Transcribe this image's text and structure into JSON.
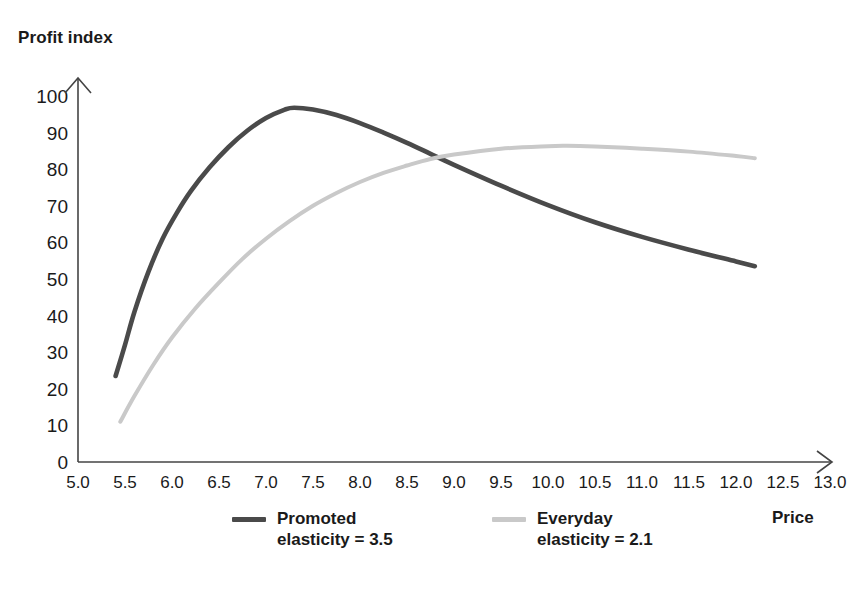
{
  "chart_data": {
    "type": "line",
    "title": "",
    "xlabel": "Price",
    "ylabel": "Profit index",
    "xlim": [
      5.0,
      13.0
    ],
    "ylim": [
      0,
      100
    ],
    "grid": false,
    "legend_position": "bottom",
    "xticks": [
      "5.0",
      "5.5",
      "6.0",
      "6.5",
      "7.0",
      "7.5",
      "8.0",
      "8.5",
      "9.0",
      "9.5",
      "10.0",
      "10.5",
      "11.0",
      "11.5",
      "12.0",
      "12.5",
      "13.0"
    ],
    "yticks": [
      "100",
      "90",
      "80",
      "70",
      "60",
      "50",
      "40",
      "30",
      "20",
      "10",
      "0"
    ],
    "series": [
      {
        "name": "Promoted",
        "sublabel": "elasticity = 3.5",
        "color": "#4a4a4a",
        "x": [
          5.4,
          5.5,
          5.6,
          5.75,
          5.9,
          6.05,
          6.2,
          6.4,
          6.6,
          6.8,
          7.0,
          7.2,
          7.3,
          7.5,
          7.75,
          8.0,
          8.25,
          8.5,
          8.75,
          9.0,
          9.5,
          10.0,
          10.5,
          11.0,
          11.5,
          12.0,
          12.2
        ],
        "y": [
          23.5,
          32.0,
          41.0,
          52.0,
          61.0,
          68.0,
          74.0,
          80.5,
          86.0,
          90.5,
          94.0,
          96.3,
          96.8,
          96.3,
          94.8,
          92.6,
          90.0,
          87.2,
          84.2,
          81.2,
          75.5,
          70.2,
          65.5,
          61.5,
          58.0,
          54.8,
          53.5
        ]
      },
      {
        "name": "Everyday",
        "sublabel": "elasticity = 2.1",
        "color": "#c9c9c9",
        "x": [
          5.45,
          5.6,
          5.8,
          6.0,
          6.25,
          6.5,
          6.75,
          7.0,
          7.25,
          7.5,
          7.75,
          8.0,
          8.25,
          8.5,
          8.75,
          9.0,
          9.5,
          10.0,
          10.2,
          10.5,
          11.0,
          11.5,
          12.0,
          12.2
        ],
        "y": [
          11.0,
          18.0,
          26.5,
          34.0,
          42.0,
          49.0,
          55.5,
          61.0,
          65.8,
          70.0,
          73.5,
          76.5,
          79.0,
          81.0,
          82.8,
          84.0,
          85.6,
          86.3,
          86.4,
          86.2,
          85.6,
          84.8,
          83.6,
          83.0
        ]
      }
    ],
    "annotations": {
      "crossing_point": {
        "x": 9.0,
        "y": 84.5
      }
    }
  },
  "axes": {
    "y_title": "Profit index",
    "x_title": "Price"
  },
  "legend": {
    "items": [
      {
        "name": "Promoted",
        "sublabel": "elasticity = 3.5",
        "color": "#4a4a4a"
      },
      {
        "name": "Everyday",
        "sublabel": "elasticity = 2.1",
        "color": "#c9c9c9"
      }
    ]
  }
}
